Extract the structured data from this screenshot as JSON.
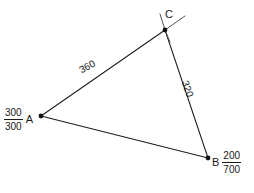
{
  "diagram": {
    "type": "triangle-with-labeled-sides",
    "background_color": "#ffffff",
    "line_color": "#1d1d1d",
    "vertices": [
      {
        "id": "A",
        "name": "A",
        "x": 41,
        "y": 116,
        "coordinate": {
          "num": "300",
          "den": "300"
        },
        "label_side": "left"
      },
      {
        "id": "B",
        "name": "B",
        "x": 208,
        "y": 158,
        "coordinate": {
          "num": "200",
          "den": "700"
        },
        "label_side": "right"
      },
      {
        "id": "C",
        "name": "C",
        "x": 165,
        "y": 30,
        "coordinate": null,
        "label_side": "above-right"
      }
    ],
    "edges": [
      {
        "id": "AC",
        "from": "A",
        "to": "C",
        "label": "360",
        "label_rotation_deg": -28.5
      },
      {
        "id": "CB",
        "from": "C",
        "to": "B",
        "label": "320",
        "label_rotation_deg": 71.5
      },
      {
        "id": "AB",
        "from": "A",
        "to": "B",
        "label": "",
        "label_rotation_deg": 0
      }
    ],
    "extensions": [
      {
        "id": "ext-ac-beyond-c",
        "at_vertex": "C",
        "direction": "up-right"
      },
      {
        "id": "ext-cb-beyond-c",
        "at_vertex": "C",
        "direction": "up"
      }
    ]
  }
}
